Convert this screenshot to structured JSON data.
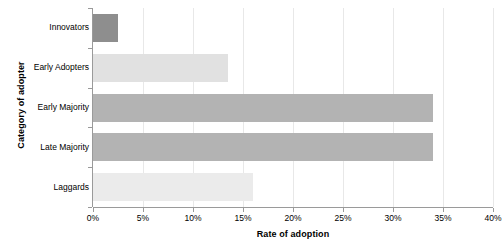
{
  "chart_data": {
    "type": "bar",
    "orientation": "horizontal",
    "title": "",
    "xlabel": "Rate of adoption",
    "ylabel": "Category of adopter",
    "categories": [
      "Innovators",
      "Early Adopters",
      "Early Majority",
      "Late Majority",
      "Laggards"
    ],
    "values": [
      2.5,
      13.5,
      34.0,
      34.0,
      16.0
    ],
    "value_unit": "%",
    "bar_colors": [
      "#8e8e8e",
      "#e1e1e1",
      "#b3b3b3",
      "#b3b3b3",
      "#ebebeb"
    ],
    "xlim": [
      0,
      40
    ],
    "xticks": [
      0,
      5,
      10,
      15,
      20,
      25,
      30,
      35,
      40
    ],
    "xtick_labels": [
      "0%",
      "5%",
      "10%",
      "15%",
      "20%",
      "25%",
      "30%",
      "35%",
      "40%"
    ],
    "grid": "vertical",
    "legend": "none",
    "background": "#ffffff",
    "axis_color": "#9a9a9a",
    "gridline_color": "#e8e8e8"
  }
}
